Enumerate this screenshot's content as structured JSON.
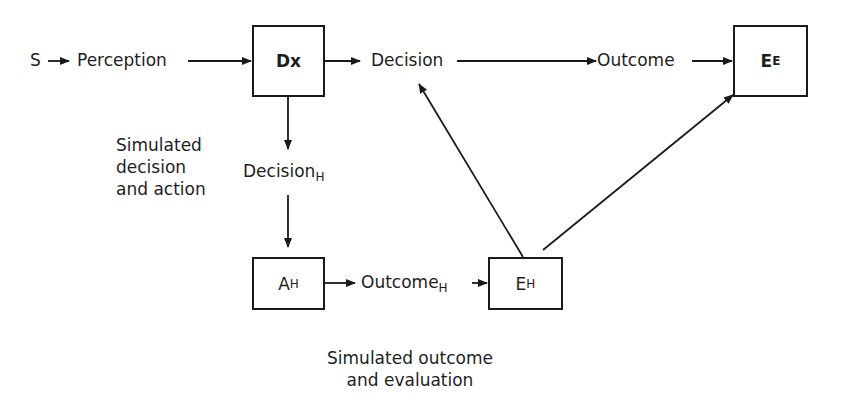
{
  "diagram": {
    "type": "flow",
    "colors": {
      "line": "#1a1a1a",
      "text": "#1e1e1e",
      "background": "#ffffff"
    },
    "nodes": {
      "s": {
        "label": "S"
      },
      "perception": {
        "label": "Perception"
      },
      "dx": {
        "label": "Dx",
        "boxed": true
      },
      "decision": {
        "label": "Decision"
      },
      "outcome": {
        "label": "Outcome"
      },
      "ee": {
        "label": "E",
        "sub": "E",
        "boxed": true
      },
      "decision_h": {
        "label": "Decision",
        "sub": "H"
      },
      "ah": {
        "label": "A",
        "sub": "H",
        "boxed": true
      },
      "outcome_h": {
        "label": "Outcome",
        "sub": "H"
      },
      "eh": {
        "label": "E",
        "sub": "H",
        "boxed": true
      }
    },
    "annotations": {
      "simulated_decision": [
        "Simulated",
        "decision",
        "and action"
      ],
      "simulated_outcome": [
        "Simulated outcome",
        "and evaluation"
      ]
    },
    "edges": [
      {
        "from": "S",
        "to": "Perception"
      },
      {
        "from": "Perception",
        "to": "Dx"
      },
      {
        "from": "Dx",
        "to": "Decision"
      },
      {
        "from": "Decision",
        "to": "Outcome"
      },
      {
        "from": "Outcome",
        "to": "E_E"
      },
      {
        "from": "Dx",
        "to": "Decision_H"
      },
      {
        "from": "Decision_H",
        "to": "A_H"
      },
      {
        "from": "A_H",
        "to": "Outcome_H"
      },
      {
        "from": "Outcome_H",
        "to": "E_H"
      },
      {
        "from": "E_H",
        "to": "Decision"
      },
      {
        "from": "E_H",
        "to": "E_E"
      }
    ]
  }
}
